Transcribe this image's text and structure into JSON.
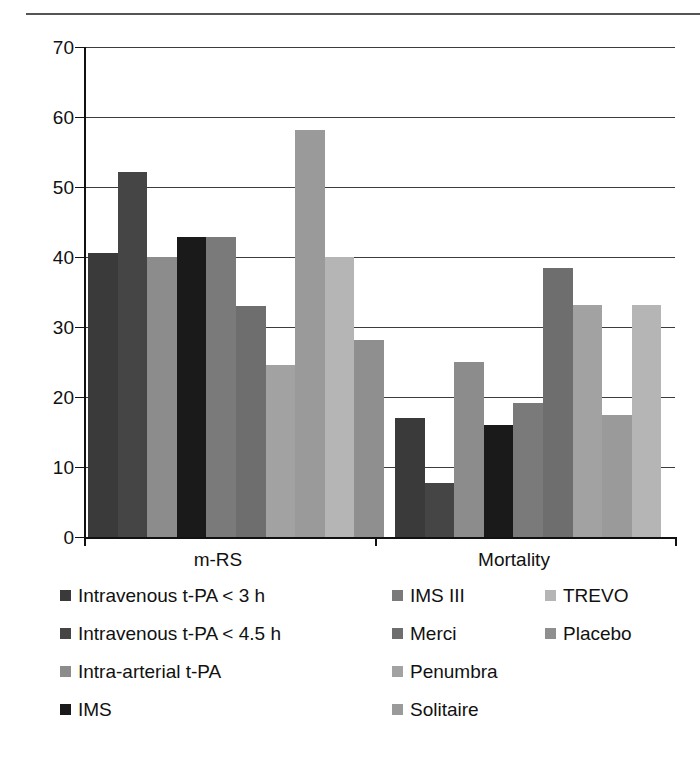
{
  "chart_data": {
    "type": "bar",
    "title": "",
    "subtitle": "",
    "xlabel": "",
    "ylabel": "",
    "ylim": [
      0,
      70
    ],
    "ytick_step": 10,
    "yticks": [
      0,
      10,
      20,
      30,
      40,
      50,
      60,
      70
    ],
    "ytick_labels": [
      "0",
      "10",
      "20",
      "30",
      "40",
      "50",
      "60",
      "70"
    ],
    "grid": "horizontal",
    "legend_position": "bottom",
    "categories": [
      "m-RS",
      "Mortality"
    ],
    "series": [
      {
        "name": "Intravenous t-PA < 3 h",
        "color": "#3a3a3a",
        "values": [
          40.6,
          17.0
        ]
      },
      {
        "name": "Intravenous t-PA < 4.5 h",
        "color": "#454545",
        "values": [
          52.2,
          7.7
        ]
      },
      {
        "name": "Intra-arterial t-PA",
        "color": "#8c8c8c",
        "values": [
          40.0,
          25.0
        ]
      },
      {
        "name": "IMS",
        "color": "#1a1a1a",
        "values": [
          42.8,
          16.0
        ]
      },
      {
        "name": "IMS III",
        "color": "#7a7a7a",
        "values": [
          42.9,
          19.2
        ]
      },
      {
        "name": "Merci",
        "color": "#6e6e6e",
        "values": [
          33.0,
          38.4
        ]
      },
      {
        "name": "Penumbra",
        "color": "#a2a2a2",
        "values": [
          24.6,
          33.2
        ]
      },
      {
        "name": "Solitaire",
        "color": "#9a9a9a",
        "values": [
          58.2,
          17.4
        ]
      },
      {
        "name": "TREVO",
        "color": "#b5b5b5",
        "values": [
          40.0,
          33.2
        ]
      },
      {
        "name": "Placebo",
        "color": "#8f8f8f",
        "values": [
          28.2,
          null
        ]
      }
    ]
  },
  "legend": {
    "columns": [
      {
        "items": [
          {
            "label": "Intravenous t-PA < 3 h",
            "color": "#3a3a3a"
          },
          {
            "label": "Intravenous t-PA < 4.5 h",
            "color": "#454545"
          },
          {
            "label": "Intra-arterial t-PA",
            "color": "#8c8c8c"
          },
          {
            "label": "IMS",
            "color": "#1a1a1a"
          }
        ]
      },
      {
        "items": [
          {
            "label": "IMS III",
            "color": "#7a7a7a"
          },
          {
            "label": "Merci",
            "color": "#6e6e6e"
          },
          {
            "label": "Penumbra",
            "color": "#a2a2a2"
          },
          {
            "label": "Solitaire",
            "color": "#9a9a9a"
          }
        ]
      },
      {
        "items": [
          {
            "label": "TREVO",
            "color": "#b5b5b5"
          },
          {
            "label": "Placebo",
            "color": "#8f8f8f"
          }
        ]
      }
    ]
  },
  "axes": {
    "group_labels": [
      "m-RS",
      "Mortality"
    ]
  },
  "colors": {
    "axis": "#111111",
    "grid": "#3c3c3c",
    "background": "#ffffff",
    "rule": "#555555"
  }
}
